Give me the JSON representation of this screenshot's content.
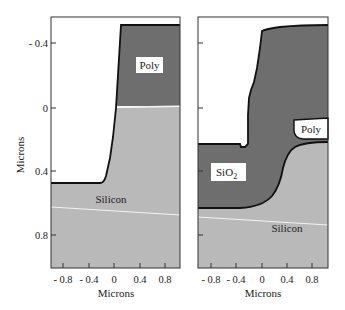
{
  "figure": {
    "colors": {
      "background": "#ffffff",
      "silicon": "#b9b9b9",
      "oxide": "#6e6e6e",
      "poly_left": "#6e6e6e",
      "poly_right": "#ffffff",
      "outline": "#111111",
      "label_box": "#ffffff",
      "interface_line": "#f2f2f2"
    },
    "y_axis": {
      "title": "Microns",
      "ticks": [
        {
          "value": -0.4,
          "label": "- 0.4"
        },
        {
          "value": 0,
          "label": "0"
        },
        {
          "value": 0.4,
          "label": "0.4"
        },
        {
          "value": 0.8,
          "label": "0.8"
        }
      ]
    },
    "panels": [
      {
        "id": "left",
        "x_axis": {
          "title": "Microns",
          "ticks": [
            {
              "value": -0.8,
              "label": "- 0.8"
            },
            {
              "value": -0.4,
              "label": "- 0.4"
            },
            {
              "value": 0,
              "label": "0"
            },
            {
              "value": 0.4,
              "label": "0.4"
            },
            {
              "value": 0.8,
              "label": "0.8"
            }
          ]
        },
        "labels": {
          "poly": "Poly",
          "silicon": "Silicon"
        }
      },
      {
        "id": "right",
        "x_axis": {
          "title": "Microns",
          "ticks": [
            {
              "value": -0.8,
              "label": "- 0.8"
            },
            {
              "value": -0.4,
              "label": "- 0.4"
            },
            {
              "value": 0,
              "label": "0"
            },
            {
              "value": 0.4,
              "label": "0.4"
            },
            {
              "value": 0.8,
              "label": "0.8"
            }
          ]
        },
        "labels": {
          "poly": "Poly",
          "oxide": "SiO",
          "oxide_subscript": "2",
          "silicon": "Silicon"
        }
      }
    ]
  }
}
